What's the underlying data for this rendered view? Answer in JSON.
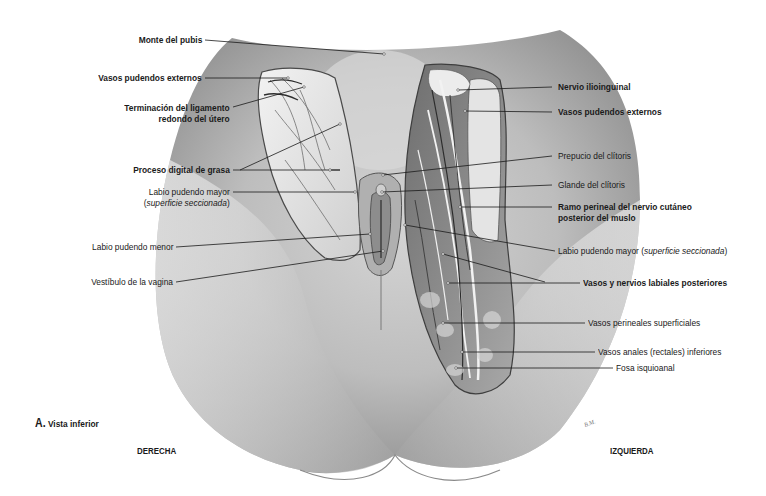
{
  "figure": {
    "caption_letter": "A.",
    "caption_text": "Vista inferior",
    "side_right": "DERECHA",
    "side_left": "IZQUIERDA",
    "signature": "B.M."
  },
  "labels_left": [
    {
      "id": "monte-pubis",
      "text": "Monte del pubis",
      "bold": true
    },
    {
      "id": "vasos-pudendos-externos-der",
      "text": "Vasos pudendos externos",
      "bold": true
    },
    {
      "id": "ligamento-redondo",
      "line1": "Terminación del ligamento",
      "line2": "redondo del útero",
      "bold": true
    },
    {
      "id": "proceso-digital",
      "text": "Proceso digital de grasa",
      "bold": true
    },
    {
      "id": "labio-mayor-der",
      "line1": "Labio pudendo mayor",
      "line2_open": "(",
      "line2_italic": "superficie seccionada",
      "line2_close": ")",
      "bold": false
    },
    {
      "id": "labio-menor",
      "text": "Labio pudendo menor",
      "bold": false
    },
    {
      "id": "vestibulo",
      "text": "Vestíbulo de la vagina",
      "bold": false
    }
  ],
  "labels_right": [
    {
      "id": "nervio-ilioinguinal",
      "text": "Nervio ilioinguinal",
      "bold": true
    },
    {
      "id": "vasos-pudendos-externos-izq",
      "text": "Vasos pudendos externos",
      "bold": true
    },
    {
      "id": "prepucio",
      "text": "Prepucio del clítoris",
      "bold": false
    },
    {
      "id": "glande",
      "text": "Glande del clítoris",
      "bold": false
    },
    {
      "id": "ramo-perineal",
      "line1": "Ramo perineal del nervio cutáneo",
      "line2": "posterior del muslo",
      "bold": true
    },
    {
      "id": "labio-mayor-izq",
      "text": "Labio pudendo mayor (",
      "italic": "superficie seccionada",
      "close": ")",
      "bold": false
    },
    {
      "id": "vasos-nervios-labiales",
      "text": "Vasos y nervios labiales posteriores",
      "bold": true
    },
    {
      "id": "vasos-perineales",
      "text": "Vasos perineales superficiales",
      "bold": false
    },
    {
      "id": "vasos-anales",
      "text": "Vasos anales (rectales) inferiores",
      "bold": false
    },
    {
      "id": "fosa-isquioanal",
      "text": "Fosa isquioanal",
      "bold": false
    }
  ],
  "colors": {
    "skin_light": "#e9e9e9",
    "skin_mid": "#c8c8c8",
    "skin_dark": "#8c8c8c",
    "tissue": "#d8d8d8",
    "vessel": "#3a3a3a",
    "leader": "#1a1a1a"
  }
}
